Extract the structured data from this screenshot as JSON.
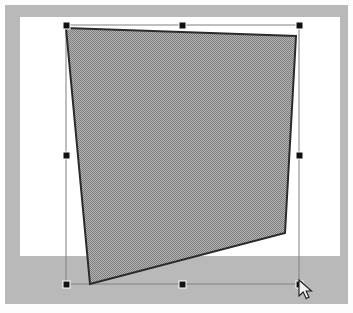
{
  "app": {
    "window_title": "",
    "canvas_background": "#ffffff",
    "frame_color": "#b9b9b9",
    "desk_color": "#b9b9b9"
  },
  "canvas": {
    "page": {
      "x": 20,
      "y": 17,
      "width": 320,
      "height": 239
    },
    "frame": {
      "x": 5,
      "y": 5,
      "width": 343,
      "height": 299
    }
  },
  "shape": {
    "name": "quadrilateral",
    "type": "polygon",
    "fill_style": "50-percent-dither-gray",
    "fill_color": "#999999",
    "stroke_color": "#2b2b2b",
    "stroke_width": 2,
    "selected": true,
    "points": [
      {
        "label": "top-left",
        "x": 66,
        "y": 28
      },
      {
        "label": "top-right",
        "x": 296,
        "y": 36
      },
      {
        "label": "bottom-right",
        "x": 285,
        "y": 233
      },
      {
        "label": "bottom-left",
        "x": 90,
        "y": 284
      }
    ],
    "points_attr": "66,28 296,36 285,233 90,284"
  },
  "selection": {
    "bounding_box": {
      "x": 66,
      "y": 25,
      "width": 233,
      "height": 259
    },
    "outline_color": "#808080",
    "handle_color": "#111111",
    "handle_border_color": "#ffffff",
    "handle_size": 6,
    "handles": [
      {
        "name": "handle-top-left",
        "x": 66,
        "y": 25
      },
      {
        "name": "handle-top-center",
        "x": 182,
        "y": 25
      },
      {
        "name": "handle-top-right",
        "x": 299,
        "y": 25
      },
      {
        "name": "handle-middle-left",
        "x": 66,
        "y": 155
      },
      {
        "name": "handle-middle-right",
        "x": 299,
        "y": 155
      },
      {
        "name": "handle-bottom-left",
        "x": 66,
        "y": 284
      },
      {
        "name": "handle-bottom-center",
        "x": 182,
        "y": 284
      },
      {
        "name": "handle-bottom-right",
        "x": 299,
        "y": 284
      }
    ]
  },
  "cursor": {
    "type": "arrow-pointer",
    "x": 298,
    "y": 279,
    "fill": "#f2f2f2",
    "stroke": "#1a1a1a"
  }
}
